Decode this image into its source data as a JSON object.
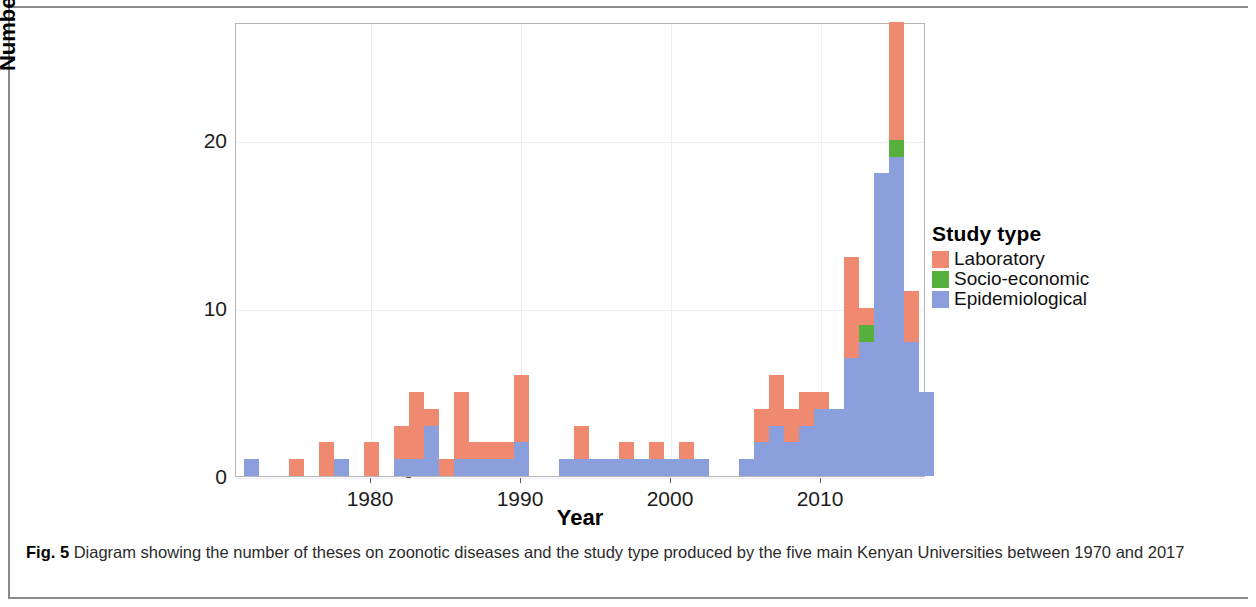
{
  "figure": {
    "label": "Fig. 5",
    "caption": " Diagram showing the number of theses on zoonotic diseases and the study type produced by the five main Kenyan Universities between 1970 and 2017"
  },
  "legend": {
    "title": "Study type",
    "items": [
      {
        "label": "Laboratory",
        "color": "#ef8a71",
        "key": "lab"
      },
      {
        "label": "Socio-economic",
        "color": "#55b03c",
        "key": "soc"
      },
      {
        "label": "Epidemiological",
        "color": "#8b9fdd",
        "key": "epi"
      }
    ]
  },
  "chart_data": {
    "type": "bar",
    "stacked": true,
    "title": "",
    "xlabel": "Year",
    "ylabel": "Number of theses produced",
    "xlim": [
      1971,
      2017
    ],
    "ylim": [
      0,
      27
    ],
    "yticks": [
      0,
      10,
      20
    ],
    "ytick_labels": [
      "0",
      "10",
      "20"
    ],
    "xticks": [
      1980,
      1990,
      2000,
      2010
    ],
    "xtick_labels": [
      "1980",
      "1990",
      "2000",
      "2010"
    ],
    "grid": true,
    "legend_position": "right",
    "series": [
      {
        "name": "Epidemiological",
        "color": "#8b9fdd"
      },
      {
        "name": "Socio-economic",
        "color": "#55b03c"
      },
      {
        "name": "Laboratory",
        "color": "#ef8a71"
      }
    ],
    "categories": [
      1972,
      1975,
      1977,
      1978,
      1980,
      1982,
      1983,
      1984,
      1985,
      1986,
      1987,
      1988,
      1989,
      1990,
      1991,
      1993,
      1994,
      1995,
      1996,
      1997,
      1998,
      1999,
      2000,
      2001,
      2002,
      2005,
      2006,
      2007,
      2008,
      2009,
      2010,
      2011,
      2012,
      2013,
      2014,
      2015,
      2016
    ],
    "bars": [
      {
        "year": 1972,
        "epi": 1,
        "soc": 0,
        "lab": 0,
        "total": 1
      },
      {
        "year": 1975,
        "epi": 0,
        "soc": 0,
        "lab": 1,
        "total": 1
      },
      {
        "year": 1977,
        "epi": 0,
        "soc": 0,
        "lab": 2,
        "total": 2
      },
      {
        "year": 1978,
        "epi": 1,
        "soc": 0,
        "lab": 0,
        "total": 1
      },
      {
        "year": 1980,
        "epi": 0,
        "soc": 0,
        "lab": 2,
        "total": 2
      },
      {
        "year": 1982,
        "epi": 1,
        "soc": 0,
        "lab": 2,
        "total": 3
      },
      {
        "year": 1983,
        "epi": 1,
        "soc": 0,
        "lab": 4,
        "total": 5
      },
      {
        "year": 1984,
        "epi": 3,
        "soc": 0,
        "lab": 1,
        "total": 4
      },
      {
        "year": 1985,
        "epi": 0,
        "soc": 0,
        "lab": 1,
        "total": 1
      },
      {
        "year": 1986,
        "epi": 1,
        "soc": 0,
        "lab": 4,
        "total": 5
      },
      {
        "year": 1987,
        "epi": 1,
        "soc": 0,
        "lab": 1,
        "total": 2
      },
      {
        "year": 1988,
        "epi": 1,
        "soc": 0,
        "lab": 1,
        "total": 2
      },
      {
        "year": 1989,
        "epi": 1,
        "soc": 0,
        "lab": 1,
        "total": 2
      },
      {
        "year": 1990,
        "epi": 2,
        "soc": 0,
        "lab": 4,
        "total": 6
      },
      {
        "year": 1991,
        "epi": 0,
        "soc": 0,
        "lab": 0,
        "total": 0
      },
      {
        "year": 1993,
        "epi": 1,
        "soc": 0,
        "lab": 0,
        "total": 1
      },
      {
        "year": 1994,
        "epi": 1,
        "soc": 0,
        "lab": 2,
        "total": 3
      },
      {
        "year": 1995,
        "epi": 1,
        "soc": 0,
        "lab": 0,
        "total": 1
      },
      {
        "year": 1996,
        "epi": 1,
        "soc": 0,
        "lab": 0,
        "total": 1
      },
      {
        "year": 1997,
        "epi": 1,
        "soc": 0,
        "lab": 1,
        "total": 2
      },
      {
        "year": 1998,
        "epi": 1,
        "soc": 0,
        "lab": 0,
        "total": 1
      },
      {
        "year": 1999,
        "epi": 1,
        "soc": 0,
        "lab": 1,
        "total": 2
      },
      {
        "year": 2000,
        "epi": 1,
        "soc": 0,
        "lab": 0,
        "total": 1
      },
      {
        "year": 2001,
        "epi": 1,
        "soc": 0,
        "lab": 1,
        "total": 2
      },
      {
        "year": 2002,
        "epi": 1,
        "soc": 0,
        "lab": 0,
        "total": 1
      },
      {
        "year": 2005,
        "epi": 1,
        "soc": 0,
        "lab": 0,
        "total": 1
      },
      {
        "year": 2006,
        "epi": 2,
        "soc": 0,
        "lab": 2,
        "total": 4
      },
      {
        "year": 2007,
        "epi": 3,
        "soc": 0,
        "lab": 3,
        "total": 6
      },
      {
        "year": 2008,
        "epi": 2,
        "soc": 0,
        "lab": 2,
        "total": 4
      },
      {
        "year": 2009,
        "epi": 3,
        "soc": 0,
        "lab": 2,
        "total": 5
      },
      {
        "year": 2010,
        "epi": 4,
        "soc": 0,
        "lab": 1,
        "total": 5
      },
      {
        "year": 2011,
        "epi": 4,
        "soc": 0,
        "lab": 0,
        "total": 4
      },
      {
        "year": 2012,
        "epi": 7,
        "soc": 0,
        "lab": 6,
        "total": 13
      },
      {
        "year": 2013,
        "epi": 8,
        "soc": 1,
        "lab": 1,
        "total": 10
      },
      {
        "year": 2014,
        "epi": 18,
        "soc": 0,
        "lab": 0,
        "total": 18
      },
      {
        "year": 2015,
        "epi": 19,
        "soc": 1,
        "lab": 7,
        "total": 27
      },
      {
        "year": 2016,
        "epi": 8,
        "soc": 0,
        "lab": 3,
        "total": 11
      },
      {
        "year": 2017,
        "epi": 5,
        "soc": 0,
        "lab": 0,
        "total": 5
      }
    ]
  }
}
